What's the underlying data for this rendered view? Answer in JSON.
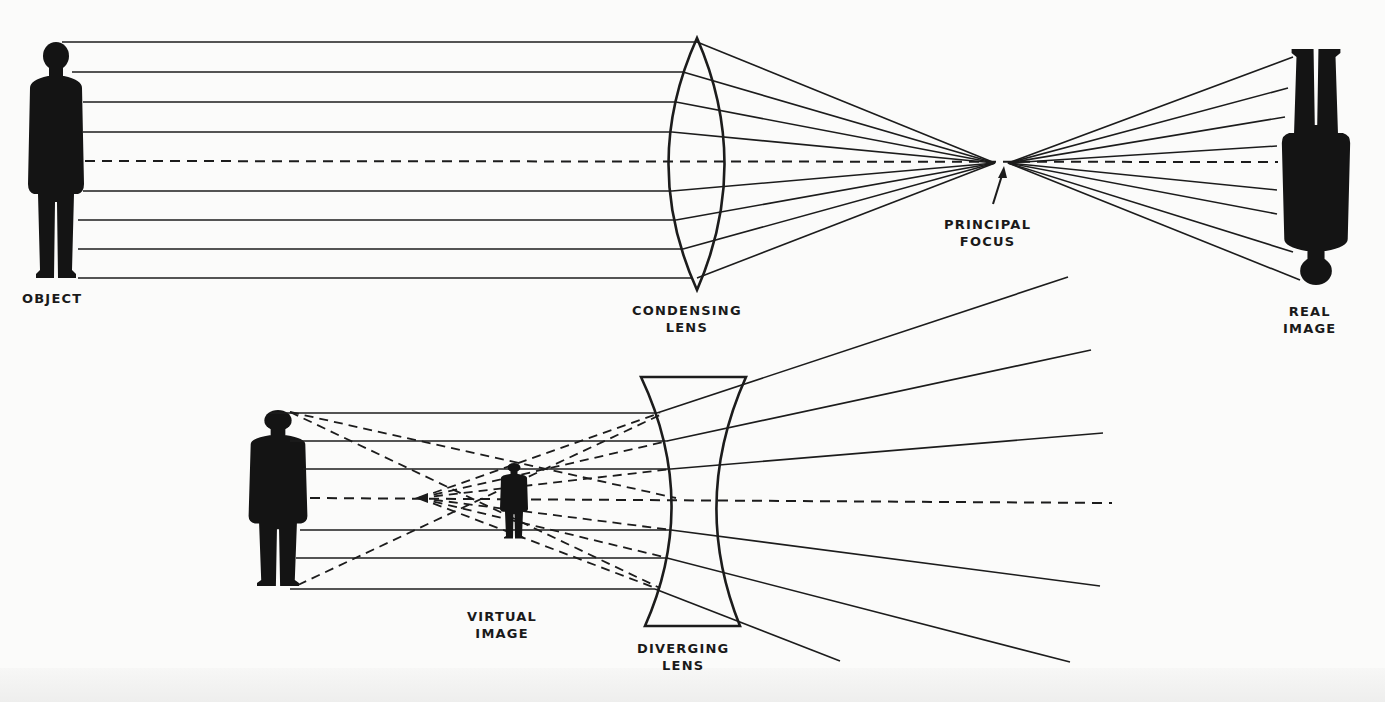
{
  "figure": {
    "top_diagram": {
      "title": "Condensing lens forming a real image",
      "labels": {
        "object": "OBJECT",
        "lens_line1": "CONDENSING",
        "lens_line2": "LENS",
        "focus_line1": "PRINCIPAL",
        "focus_line2": "FOCUS",
        "image_line1": "REAL",
        "image_line2": "IMAGE"
      },
      "object_figure": {
        "x": 55,
        "top": 42,
        "bottom": 278,
        "orientation": "upright"
      },
      "lens": {
        "type": "biconvex",
        "cx": 694,
        "top": 38,
        "bottom": 290
      },
      "principal_focus": {
        "x": 995,
        "y": 163
      },
      "real_image": {
        "x": 1315,
        "top": 48,
        "bottom": 285,
        "orientation": "inverted"
      },
      "optical_axis_y": 161,
      "ray_ys": [
        42,
        72,
        102,
        132,
        191,
        220,
        249,
        278
      ],
      "ray_lens_exit_ys": [
        44,
        72,
        102,
        132,
        191,
        220,
        249,
        278
      ],
      "ray_image_ends": [
        [
          1296,
          57
        ],
        [
          1288,
          88
        ],
        [
          1283,
          117
        ],
        [
          1277,
          146
        ],
        [
          1277,
          193
        ],
        [
          1277,
          214
        ],
        [
          1296,
          252
        ],
        [
          1300,
          280
        ]
      ]
    },
    "bottom_diagram": {
      "title": "Diverging lens forming a virtual image",
      "labels": {
        "virtual_line1": "VIRTUAL",
        "virtual_line2": "IMAGE",
        "lens_line1": "DIVERGING",
        "lens_line2": "LENS"
      },
      "object_figure": {
        "x": 276,
        "top": 410,
        "bottom": 586,
        "orientation": "upright"
      },
      "virtual_image": {
        "x": 513,
        "top": 463,
        "bottom": 538
      },
      "virtual_focus": {
        "x": 419,
        "y": 498
      },
      "lens": {
        "type": "biconcave",
        "left_top": 641,
        "right_top": 746,
        "top": 377,
        "bottom": 626
      },
      "optical_axis_y": 500,
      "ray_ys": [
        413,
        441,
        469,
        530,
        558,
        589
      ],
      "ray_far_ends": [
        [
          1068,
          277
        ],
        [
          1091,
          350
        ],
        [
          1103,
          433
        ],
        [
          1100,
          586
        ],
        [
          1070,
          662
        ],
        [
          840,
          661
        ]
      ]
    }
  }
}
